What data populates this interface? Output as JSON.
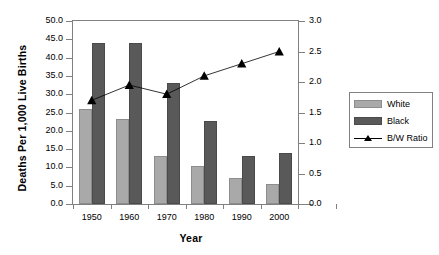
{
  "chart_data": {
    "type": "bar",
    "title": "",
    "subtitle": "",
    "xlabel": "Year",
    "ylabel": "Deaths Per 1,000 Live Births",
    "y2label": "B/W Ratio",
    "categories": [
      "1950",
      "1960",
      "1970",
      "1980",
      "1990",
      "2000"
    ],
    "ylim": [
      0.0,
      50.0
    ],
    "ytick_step": 5.0,
    "yticks": [
      "0.0",
      "5.0",
      "10.0",
      "15.0",
      "20.0",
      "25.0",
      "30.0",
      "35.0",
      "40.0",
      "45.0",
      "50.0"
    ],
    "y2lim": [
      0.0,
      3.0
    ],
    "y2tick_step": 0.5,
    "y2ticks": [
      "0.0",
      "0.5",
      "1.0",
      "1.5",
      "2.0",
      "2.5",
      "3.0"
    ],
    "grid": false,
    "legend_position": "right",
    "series": [
      {
        "name": "White",
        "type": "bar",
        "axis": "left",
        "color": "#a9a9a9",
        "values": [
          26.0,
          23.2,
          13.2,
          10.5,
          7.0,
          5.5
        ]
      },
      {
        "name": "Black",
        "type": "bar",
        "axis": "left",
        "color": "#595959",
        "values": [
          44.0,
          44.1,
          33.0,
          22.6,
          13.2,
          14.0
        ]
      },
      {
        "name": "B/W Ratio",
        "type": "line",
        "axis": "right",
        "color": "#000000",
        "marker": "triangle",
        "values": [
          1.7,
          1.95,
          1.8,
          2.1,
          2.3,
          2.5
        ]
      }
    ]
  },
  "legend": {
    "items": [
      {
        "label": "White",
        "swatch": "white-bar-swatch"
      },
      {
        "label": "Black",
        "swatch": "black-bar-swatch"
      },
      {
        "label": "B/W Ratio",
        "swatch": "line-marker-swatch"
      }
    ]
  }
}
